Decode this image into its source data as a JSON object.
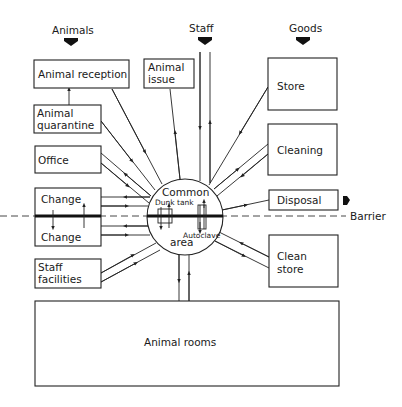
{
  "inputs": {
    "animals": "Animals",
    "staff": "Staff",
    "goods": "Goods"
  },
  "boxes": {
    "animal_reception": "Animal reception",
    "animal_quarantine": [
      "Animal",
      "quarantine"
    ],
    "office": "Office",
    "change_upper": "Change",
    "change_lower": "Change",
    "staff_facilities": [
      "Staff",
      "facilities"
    ],
    "animal_issue": [
      "Animal",
      "issue"
    ],
    "store": "Store",
    "cleaning": "Cleaning",
    "disposal": "Disposal",
    "clean_store": [
      "Clean",
      "store"
    ],
    "animal_rooms": "Animal rooms"
  },
  "hub": {
    "label_top": "Common",
    "label_bottom": "area",
    "dunk_tank": "Dunk tank",
    "autoclave": "Autoclave"
  },
  "barrier": {
    "label": "Barrier"
  },
  "colors": {
    "ink": "#222222",
    "background": "#ffffff"
  }
}
